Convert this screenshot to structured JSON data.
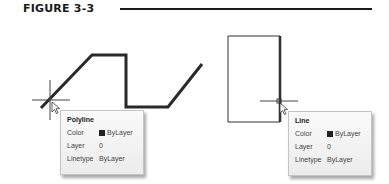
{
  "figure": {
    "label": "FIGURE 3-3"
  },
  "left_example": {
    "object": "polyline",
    "tooltip": {
      "title": "Polyline",
      "rows": [
        {
          "key": "Color",
          "value": "ByLayer",
          "swatch": "#222222"
        },
        {
          "key": "Layer",
          "value": "0"
        },
        {
          "key": "Linetype",
          "value": "ByLayer"
        }
      ]
    }
  },
  "right_example": {
    "object": "line",
    "tooltip": {
      "title": "Line",
      "rows": [
        {
          "key": "Color",
          "value": "ByLayer",
          "swatch": "#222222"
        },
        {
          "key": "Layer",
          "value": "0"
        },
        {
          "key": "Linetype",
          "value": "ByLayer"
        }
      ]
    }
  },
  "colors": {
    "ink": "#1a1a1a",
    "highlight": "#333333",
    "tooltip_bg": "#f3f3f3"
  }
}
